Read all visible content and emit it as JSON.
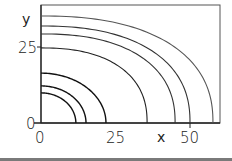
{
  "chart_data": {
    "type": "line",
    "title": "",
    "xlabel": "x",
    "ylabel": "y",
    "xlim": [
      0,
      60
    ],
    "ylim": [
      0,
      39
    ],
    "xticks": [
      0,
      25,
      50
    ],
    "yticks": [
      0,
      25
    ],
    "grid": false,
    "legend": null,
    "series": [
      {
        "name": "curve-1",
        "x_intercept": 11.7,
        "y_intercept": 9.9,
        "stroke": "#111111"
      },
      {
        "name": "curve-2",
        "x_intercept": 15.1,
        "y_intercept": 12.2,
        "stroke": "#111111"
      },
      {
        "name": "curve-3",
        "x_intercept": 21.8,
        "y_intercept": 16.4,
        "stroke": "#111111"
      },
      {
        "name": "curve-4",
        "x_intercept": 35.6,
        "y_intercept": 24.7,
        "stroke": "#222222"
      },
      {
        "name": "curve-5",
        "x_intercept": 45.0,
        "y_intercept": 29.3,
        "stroke": "#333333"
      },
      {
        "name": "curve-6",
        "x_intercept": 50.0,
        "y_intercept": 31.9,
        "stroke": "#333333"
      },
      {
        "name": "curve-7",
        "x_intercept": 57.7,
        "y_intercept": 35.2,
        "stroke": "#555555"
      }
    ]
  },
  "labels": {
    "y_axis": "y",
    "x_axis": "x",
    "y_tick_25": "25",
    "y_tick_0": "0",
    "x_tick_0": "0",
    "x_tick_25": "25",
    "x_tick_50": "50"
  }
}
